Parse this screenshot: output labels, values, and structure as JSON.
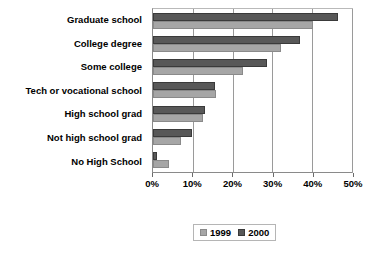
{
  "chart_data": {
    "type": "bar",
    "orientation": "horizontal",
    "title": "",
    "xlabel": "",
    "ylabel": "",
    "xlim": [
      0,
      50
    ],
    "grid": true,
    "legend_position": "bottom",
    "categories": [
      "Graduate school",
      "College degree",
      "Some college",
      "Tech or vocational school",
      "High school grad",
      "Not high school grad",
      "No High School"
    ],
    "tick_labels": [
      "0%",
      "10%",
      "20%",
      "30%",
      "40%",
      "50%"
    ],
    "tick_values": [
      0,
      10,
      20,
      30,
      40,
      50
    ],
    "series": [
      {
        "name": "1999",
        "color": "#a6a6a6",
        "values": [
          40.2,
          32.2,
          22.5,
          15.8,
          12.5,
          7.0,
          4.0
        ]
      },
      {
        "name": "2000",
        "color": "#585858",
        "values": [
          46.4,
          36.9,
          28.7,
          15.5,
          13.0,
          9.8,
          1.0
        ]
      }
    ]
  },
  "legend": {
    "entries": [
      {
        "label": "1999",
        "swatch": "legend-swatch-1999"
      },
      {
        "label": "2000",
        "swatch": "legend-swatch-2000"
      }
    ]
  }
}
